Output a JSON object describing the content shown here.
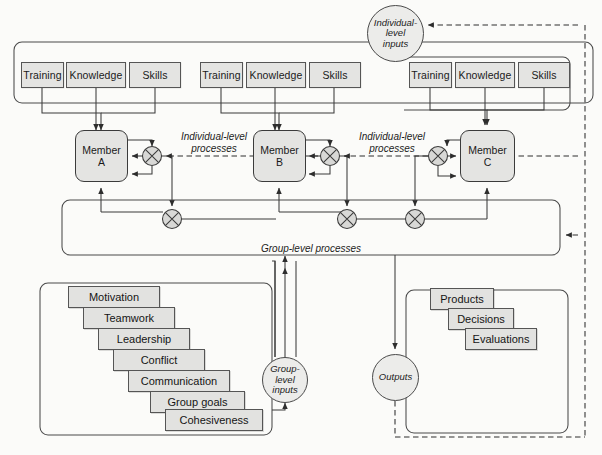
{
  "diagram": {
    "nodes": {
      "individual_inputs_circle": {
        "lines": [
          "Individual-",
          "level",
          "inputs"
        ]
      },
      "group_inputs_circle": {
        "lines": [
          "Group-",
          "level",
          "inputs"
        ]
      },
      "outputs_circle": {
        "lines": [
          "Outputs"
        ]
      }
    },
    "input_groups": [
      {
        "id": "a",
        "boxes": [
          "Training",
          "Knowledge",
          "Skills"
        ]
      },
      {
        "id": "b",
        "boxes": [
          "Training",
          "Knowledge",
          "Skills"
        ]
      },
      {
        "id": "c",
        "boxes": [
          "Training",
          "Knowledge",
          "Skills"
        ]
      }
    ],
    "members": [
      {
        "line1": "Member",
        "line2": "A"
      },
      {
        "line1": "Member",
        "line2": "B"
      },
      {
        "line1": "Member",
        "line2": "C"
      }
    ],
    "process_labels": {
      "individual_1": [
        "Individual-level",
        "processes"
      ],
      "individual_2": [
        "Individual-level",
        "processes"
      ],
      "group": "Group-level processes"
    },
    "group_input_stack": [
      "Motivation",
      "Teamwork",
      "Leadership",
      "Conflict",
      "Communication",
      "Group goals",
      "Cohesiveness"
    ],
    "output_stack": [
      "Products",
      "Decisions",
      "Evaluations"
    ],
    "colors": {
      "box_fill": "#e4e4e2",
      "stroke": "#3b3b3b",
      "background": "#fbfbf9",
      "circle_fill": "#ececea"
    }
  }
}
